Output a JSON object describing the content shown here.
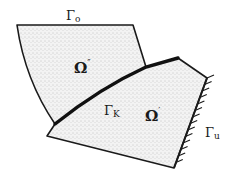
{
  "figure": {
    "colors": {
      "ink": "#1a1a1a",
      "fill": "#f1f1f1",
      "stipple": "#8a8a8a",
      "background": "#ffffff"
    }
  },
  "regions": [
    {
      "id": "omega_double_prime",
      "label": "Ω″",
      "base": "Ω",
      "mark": "″"
    },
    {
      "id": "omega_prime",
      "label": "Ω′",
      "base": "Ω",
      "mark": "′"
    }
  ],
  "boundaries": [
    {
      "id": "gamma_o",
      "label": "Γo",
      "base": "Γ",
      "sub": "o",
      "kind": "free"
    },
    {
      "id": "gamma_k",
      "label": "ΓK",
      "base": "Γ",
      "sub": "K",
      "kind": "contact"
    },
    {
      "id": "gamma_u",
      "label": "Γu",
      "base": "Γ",
      "sub": "u",
      "kind": "fixed (hatched)"
    }
  ]
}
